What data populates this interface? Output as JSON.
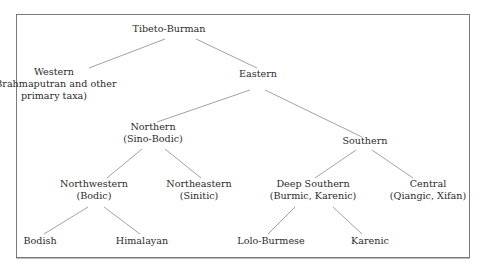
{
  "diagram": {
    "type": "tree",
    "line_color": "#8a8a8a",
    "text_color": "#2b2b2b",
    "root": {
      "id": "tibeto-burman",
      "lines": [
        "Tibeto-Burman"
      ],
      "children": [
        "western",
        "eastern"
      ]
    },
    "nodes": {
      "tibeto_burman": {
        "lines": [
          "Tibeto-Burman"
        ]
      },
      "western": {
        "lines": [
          "Western",
          "(Brahmaputran and other",
          "primary taxa)"
        ]
      },
      "eastern": {
        "lines": [
          "Eastern"
        ]
      },
      "northern": {
        "lines": [
          "Northern",
          "(Sino-Bodic)"
        ]
      },
      "southern": {
        "lines": [
          "Southern"
        ]
      },
      "northwestern": {
        "lines": [
          "Northwestern",
          "(Bodic)"
        ]
      },
      "northeastern": {
        "lines": [
          "Northeastern",
          "(Sinitic)"
        ]
      },
      "deep_southern": {
        "lines": [
          "Deep Southern",
          "(Burmic, Karenic)"
        ]
      },
      "central": {
        "lines": [
          "Central",
          "(Qiangic, Xifan)"
        ]
      },
      "bodish": {
        "lines": [
          "Bodish"
        ]
      },
      "himalayan": {
        "lines": [
          "Himalayan"
        ]
      },
      "lolo_burmese": {
        "lines": [
          "Lolo-Burmese"
        ]
      },
      "karenic": {
        "lines": [
          "Karenic"
        ]
      }
    },
    "edges": [
      [
        "tibeto_burman",
        "western"
      ],
      [
        "tibeto_burman",
        "eastern"
      ],
      [
        "eastern",
        "northern"
      ],
      [
        "eastern",
        "southern"
      ],
      [
        "northern",
        "northwestern"
      ],
      [
        "northern",
        "northeastern"
      ],
      [
        "southern",
        "deep_southern"
      ],
      [
        "southern",
        "central"
      ],
      [
        "northwestern",
        "bodish"
      ],
      [
        "northwestern",
        "himalayan"
      ],
      [
        "deep_southern",
        "lolo_burmese"
      ],
      [
        "deep_southern",
        "karenic"
      ]
    ]
  }
}
